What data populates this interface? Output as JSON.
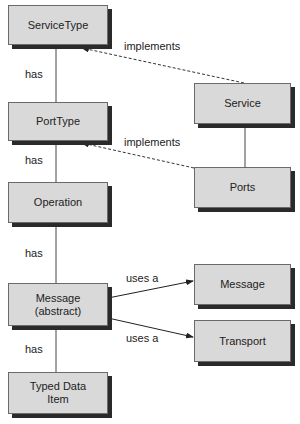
{
  "nodes": {
    "service_type": {
      "label": "ServiceType"
    },
    "port_type": {
      "label": "PortType"
    },
    "operation": {
      "label": "Operation"
    },
    "message_abstract": {
      "label": "Message\n(abstract)",
      "line1": "Message",
      "line2": "(abstract)"
    },
    "typed_data_item": {
      "line1": "Typed Data",
      "line2": "Item"
    },
    "service": {
      "label": "Service"
    },
    "ports": {
      "label": "Ports"
    },
    "message": {
      "label": "Message"
    },
    "transport": {
      "label": "Transport"
    }
  },
  "edges": {
    "servicetype_porttype": {
      "label": "has"
    },
    "porttype_operation": {
      "label": "has"
    },
    "operation_message": {
      "label": "has"
    },
    "message_typeddata": {
      "label": "has"
    },
    "service_servicetype": {
      "label": "implements"
    },
    "ports_porttype": {
      "label": "implements"
    },
    "message_uses_message": {
      "label": "uses a"
    },
    "message_uses_transport": {
      "label": "uses a"
    }
  },
  "colors": {
    "box_fill": "#d9d9d9",
    "shadow": "#2a2a2a",
    "line": "#333333"
  }
}
